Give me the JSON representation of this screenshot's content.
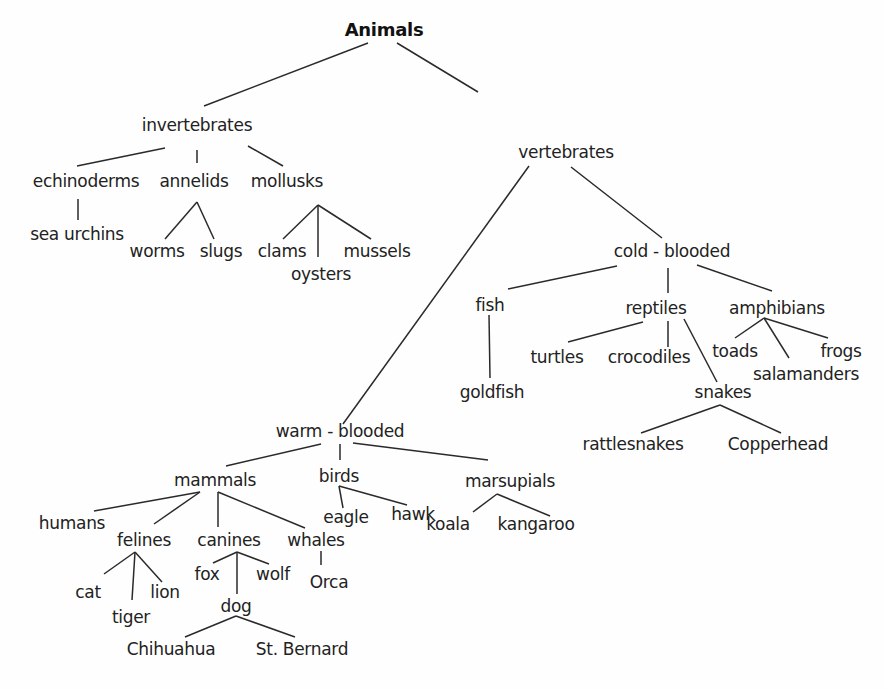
{
  "title": "Animals",
  "nodes": {
    "animals": {
      "label": "Animals",
      "x": 384,
      "y": 29
    },
    "invertebrates": {
      "label": "invertebrates",
      "x": 197,
      "y": 125
    },
    "vertebrates": {
      "label": "vertebrates",
      "x": 566,
      "y": 152
    },
    "echinoderms": {
      "label": "echinoderms",
      "x": 86,
      "y": 181
    },
    "annelids": {
      "label": "annelids",
      "x": 194,
      "y": 181
    },
    "mollusks": {
      "label": "mollusks",
      "x": 287,
      "y": 181
    },
    "sea_urchins": {
      "label": "sea urchins",
      "x": 77,
      "y": 234
    },
    "worms": {
      "label": "worms",
      "x": 157,
      "y": 251
    },
    "slugs": {
      "label": "slugs",
      "x": 221,
      "y": 251
    },
    "clams": {
      "label": "clams",
      "x": 282,
      "y": 251
    },
    "oysters": {
      "label": "oysters",
      "x": 321,
      "y": 274
    },
    "mussels": {
      "label": "mussels",
      "x": 377,
      "y": 251
    },
    "cold_blooded": {
      "label": "cold - blooded",
      "x": 672,
      "y": 251
    },
    "fish": {
      "label": "fish",
      "x": 490,
      "y": 305
    },
    "reptiles": {
      "label": "reptiles",
      "x": 656,
      "y": 308
    },
    "amphibians": {
      "label": "amphibians",
      "x": 777,
      "y": 308
    },
    "turtles": {
      "label": "turtles",
      "x": 557,
      "y": 357
    },
    "crocodiles": {
      "label": "crocodiles",
      "x": 649,
      "y": 357
    },
    "toads": {
      "label": "toads",
      "x": 735,
      "y": 351
    },
    "frogs": {
      "label": "frogs",
      "x": 841,
      "y": 351
    },
    "salamanders": {
      "label": "salamanders",
      "x": 806,
      "y": 374
    },
    "goldfish": {
      "label": "goldfish",
      "x": 492,
      "y": 392
    },
    "snakes": {
      "label": "snakes",
      "x": 723,
      "y": 392
    },
    "rattlesnakes": {
      "label": "rattlesnakes",
      "x": 633,
      "y": 444
    },
    "copperhead": {
      "label": "Copperhead",
      "x": 778,
      "y": 444
    },
    "warm_blooded": {
      "label": "warm - blooded",
      "x": 340,
      "y": 431
    },
    "mammals": {
      "label": "mammals",
      "x": 215,
      "y": 480
    },
    "birds": {
      "label": "birds",
      "x": 339,
      "y": 476
    },
    "marsupials": {
      "label": "marsupials",
      "x": 510,
      "y": 481
    },
    "humans": {
      "label": "humans",
      "x": 72,
      "y": 523
    },
    "felines": {
      "label": "felines",
      "x": 144,
      "y": 540
    },
    "canines": {
      "label": "canines",
      "x": 229,
      "y": 540
    },
    "whales": {
      "label": "whales",
      "x": 316,
      "y": 540
    },
    "eagle": {
      "label": "eagle",
      "x": 346,
      "y": 517
    },
    "hawk": {
      "label": "hawk",
      "x": 413,
      "y": 514
    },
    "koala": {
      "label": "koala",
      "x": 448,
      "y": 524
    },
    "kangaroo": {
      "label": "kangaroo",
      "x": 536,
      "y": 524
    },
    "cat": {
      "label": "cat",
      "x": 88,
      "y": 592
    },
    "lion": {
      "label": "lion",
      "x": 165,
      "y": 592
    },
    "tiger": {
      "label": "tiger",
      "x": 131,
      "y": 617
    },
    "fox": {
      "label": "fox",
      "x": 207,
      "y": 574
    },
    "wolf": {
      "label": "wolf",
      "x": 273,
      "y": 574
    },
    "orca": {
      "label": "Orca",
      "x": 329,
      "y": 582
    },
    "dog": {
      "label": "dog",
      "x": 236,
      "y": 606
    },
    "chihuahua": {
      "label": "Chihuahua",
      "x": 171,
      "y": 649
    },
    "st_bernard": {
      "label": "St. Bernard",
      "x": 302,
      "y": 649
    }
  },
  "edges": [
    [
      368,
      43,
      204,
      106
    ],
    [
      397,
      43,
      478,
      92
    ],
    [
      165,
      148,
      77,
      166
    ],
    [
      197,
      150,
      197,
      163
    ],
    [
      248,
      146,
      283,
      166
    ],
    [
      78,
      199,
      78,
      220
    ],
    [
      197,
      202,
      165,
      239
    ],
    [
      197,
      202,
      214,
      239
    ],
    [
      318,
      205,
      283,
      239
    ],
    [
      318,
      205,
      318,
      257
    ],
    [
      318,
      205,
      371,
      239
    ],
    [
      529,
      166,
      343,
      424
    ],
    [
      571,
      167,
      662,
      238
    ],
    [
      617,
      266,
      508,
      289
    ],
    [
      668,
      268,
      668,
      293
    ],
    [
      697,
      265,
      772,
      291
    ],
    [
      489,
      315,
      490,
      378
    ],
    [
      643,
      322,
      568,
      342
    ],
    [
      668,
      321,
      668,
      347
    ],
    [
      684,
      319,
      717,
      382
    ],
    [
      764,
      318,
      735,
      338
    ],
    [
      764,
      318,
      789,
      358
    ],
    [
      764,
      318,
      828,
      338
    ],
    [
      720,
      405,
      641,
      433
    ],
    [
      720,
      405,
      781,
      433
    ],
    [
      321,
      444,
      226,
      466
    ],
    [
      340,
      444,
      340,
      460
    ],
    [
      353,
      443,
      488,
      460
    ],
    [
      200,
      492,
      94,
      511
    ],
    [
      200,
      492,
      154,
      524
    ],
    [
      218,
      492,
      218,
      527
    ],
    [
      218,
      492,
      305,
      528
    ],
    [
      339,
      486,
      343,
      508
    ],
    [
      339,
      486,
      407,
      505
    ],
    [
      497,
      494,
      473,
      512
    ],
    [
      497,
      494,
      550,
      516
    ],
    [
      135,
      552,
      104,
      574
    ],
    [
      135,
      552,
      132,
      600
    ],
    [
      135,
      552,
      162,
      582
    ],
    [
      237,
      552,
      213,
      563
    ],
    [
      237,
      552,
      269,
      564
    ],
    [
      237,
      552,
      237,
      594
    ],
    [
      321,
      551,
      321,
      565
    ],
    [
      236,
      616,
      185,
      637
    ],
    [
      236,
      616,
      295,
      637
    ]
  ]
}
